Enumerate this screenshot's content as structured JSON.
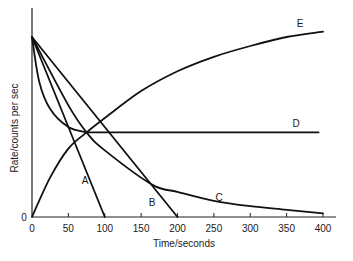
{
  "chart_data": {
    "type": "line",
    "title": "",
    "xlabel": "Time/seconds",
    "ylabel": "Rate/counts per sec",
    "xlim": [
      0,
      400
    ],
    "ylim": [
      0,
      100
    ],
    "x_ticks": [
      0,
      50,
      100,
      150,
      200,
      250,
      300,
      350,
      400
    ],
    "y_ticks": [
      0
    ],
    "grid": false,
    "legend": "inline curve labels",
    "series": [
      {
        "name": "A",
        "shape": "straight line",
        "points": [
          [
            0,
            100
          ],
          [
            100,
            0
          ]
        ]
      },
      {
        "name": "B",
        "shape": "straight line",
        "points": [
          [
            0,
            100
          ],
          [
            200,
            0
          ]
        ]
      },
      {
        "name": "C",
        "shape": "exponential decay",
        "points": [
          [
            0,
            100
          ],
          [
            50,
            62
          ],
          [
            75,
            47
          ],
          [
            100,
            37
          ],
          [
            165,
            18
          ],
          [
            200,
            14
          ],
          [
            250,
            9
          ],
          [
            300,
            6
          ],
          [
            350,
            4
          ],
          [
            400,
            2
          ]
        ]
      },
      {
        "name": "D",
        "shape": "rapid decay to constant",
        "points": [
          [
            0,
            100
          ],
          [
            10,
            75
          ],
          [
            25,
            60
          ],
          [
            50,
            50
          ],
          [
            75,
            47
          ],
          [
            150,
            47
          ],
          [
            400,
            47
          ]
        ]
      },
      {
        "name": "E",
        "shape": "exponential growth to saturation",
        "points": [
          [
            0,
            0
          ],
          [
            25,
            22
          ],
          [
            50,
            38
          ],
          [
            75,
            47
          ],
          [
            100,
            55
          ],
          [
            150,
            70
          ],
          [
            200,
            81
          ],
          [
            250,
            89
          ],
          [
            300,
            95
          ],
          [
            350,
            100
          ],
          [
            400,
            103
          ]
        ]
      }
    ],
    "annotations": [
      "A",
      "B",
      "C",
      "D",
      "E"
    ]
  },
  "axes": {
    "y_label": "Rate/counts per sec",
    "x_label": "Time/seconds",
    "y_zero": "0"
  }
}
